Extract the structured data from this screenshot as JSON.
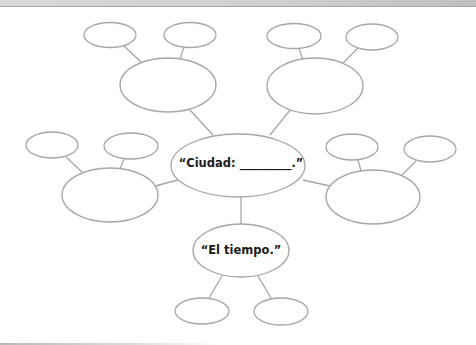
{
  "diagram": {
    "type": "word-web",
    "center_node": {
      "label": "“Ciudad: _________.”",
      "prompt": "Ciudad",
      "blank": true
    },
    "branch_nodes": [
      {
        "id": "top-left",
        "label": "",
        "children": [
          "",
          ""
        ]
      },
      {
        "id": "top-right",
        "label": "",
        "children": [
          "",
          ""
        ]
      },
      {
        "id": "left",
        "label": "",
        "children": [
          "",
          ""
        ]
      },
      {
        "id": "right",
        "label": "",
        "children": [
          "",
          ""
        ]
      },
      {
        "id": "bottom",
        "label": "“El tiempo.”",
        "children": [
          "",
          ""
        ]
      }
    ],
    "colors": {
      "outline": "#a6a6a6",
      "text": "#1a1a1a",
      "background": "#ffffff"
    }
  }
}
